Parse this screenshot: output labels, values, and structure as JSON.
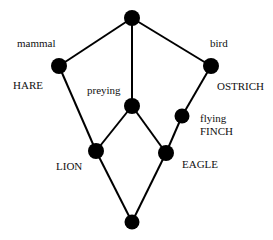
{
  "diagram": {
    "type": "concept-lattice",
    "colors": {
      "node": "#000000",
      "edge": "#000000",
      "text": "#111111",
      "background": "#ffffff"
    },
    "nodes": [
      {
        "id": "top",
        "x": 132,
        "y": 18
      },
      {
        "id": "mammal",
        "x": 59,
        "y": 66
      },
      {
        "id": "bird",
        "x": 211,
        "y": 66
      },
      {
        "id": "preying",
        "x": 132,
        "y": 106
      },
      {
        "id": "flying",
        "x": 182,
        "y": 116
      },
      {
        "id": "lion",
        "x": 96,
        "y": 151
      },
      {
        "id": "eagle",
        "x": 166,
        "y": 153
      },
      {
        "id": "bottom",
        "x": 132,
        "y": 222
      }
    ],
    "edges": [
      [
        "top",
        "mammal"
      ],
      [
        "top",
        "bird"
      ],
      [
        "top",
        "preying"
      ],
      [
        "mammal",
        "lion"
      ],
      [
        "preying",
        "lion"
      ],
      [
        "preying",
        "eagle"
      ],
      [
        "bird",
        "flying"
      ],
      [
        "flying",
        "eagle"
      ],
      [
        "lion",
        "bottom"
      ],
      [
        "eagle",
        "bottom"
      ]
    ],
    "attribute_labels": {
      "mammal": "mammal",
      "bird": "bird",
      "preying": "preying",
      "flying": "flying"
    },
    "object_labels": {
      "hare": "HARE",
      "ostrich": "OSTRICH",
      "finch": "FINCH",
      "lion": "LION",
      "eagle": "EAGLE"
    }
  }
}
